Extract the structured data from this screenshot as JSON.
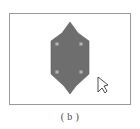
{
  "figure": {
    "caption": "( b )",
    "label": "b"
  },
  "canvas": {
    "background_color": "#ffffff",
    "border_color": "#9a9a9a",
    "x": 9,
    "y": 13,
    "width": 122,
    "height": 92
  },
  "shape": {
    "name": "hexagonal-polygon",
    "fill_color": "#6e6e6e",
    "stroke_color": "#5e5e5e",
    "points": "70,22 78,33 89,41 89,74 76,86 70,94 64,86 51,74 51,41 62,33",
    "description": "selected hexagonal polygon"
  },
  "handles": {
    "fill_color": "#b5b5b5",
    "stroke_color": "#8f8f8f",
    "size": 3,
    "points": [
      {
        "name": "handle-top-left",
        "x": 57,
        "y": 44
      },
      {
        "name": "handle-top-right",
        "x": 81,
        "y": 44
      },
      {
        "name": "handle-bottom-left",
        "x": 57,
        "y": 72
      },
      {
        "name": "handle-bottom-right",
        "x": 81,
        "y": 72
      }
    ]
  },
  "cursor": {
    "name": "mouse-pointer",
    "fill_color": "#ffffff",
    "stroke_color": "#3a3a3a",
    "points": "98,77 98,92 102,88 105,93 107,91 104,86 108,85",
    "x": 98,
    "y": 77
  }
}
